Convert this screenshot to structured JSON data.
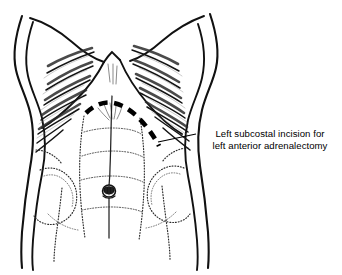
{
  "figure": {
    "title": "Left subcostal incision for left anterior adrenalectomy",
    "view": "Anterior view of abdomen and lower thorax",
    "style": "black and white medical line drawing",
    "background_color": "#ffffff",
    "line_color": "#000000"
  },
  "annotation": {
    "line1": "Left subcostal incision for",
    "line2": "left anterior adrenalectomy",
    "leader_from": "incision marking on patient's left subcostal region",
    "leader_to": "text label at right"
  },
  "anatomy": {
    "landmarks": [
      {
        "name": "xiphoid-process",
        "label": "Xiphoid process"
      },
      {
        "name": "costal-margin-left",
        "label": "Left costal margin"
      },
      {
        "name": "costal-margin-right",
        "label": "Right costal margin"
      },
      {
        "name": "ribcage-left",
        "label": "Left ribs"
      },
      {
        "name": "ribcage-right",
        "label": "Right ribs"
      },
      {
        "name": "linea-alba",
        "label": "Linea alba"
      },
      {
        "name": "rectus-abdominis",
        "label": "Rectus abdominis"
      },
      {
        "name": "tendinous-intersections",
        "label": "Tendinous intersections"
      },
      {
        "name": "external-oblique",
        "label": "External oblique"
      },
      {
        "name": "umbilicus",
        "label": "Umbilicus"
      },
      {
        "name": "iliac-crest",
        "label": "Iliac crest"
      }
    ],
    "incision": {
      "name": "left-subcostal-incision",
      "label": "Left subcostal incision",
      "rendering": "bold dashed curved line",
      "course": "from epigastrium across midline curving inferolaterally below the left costal margin"
    }
  }
}
